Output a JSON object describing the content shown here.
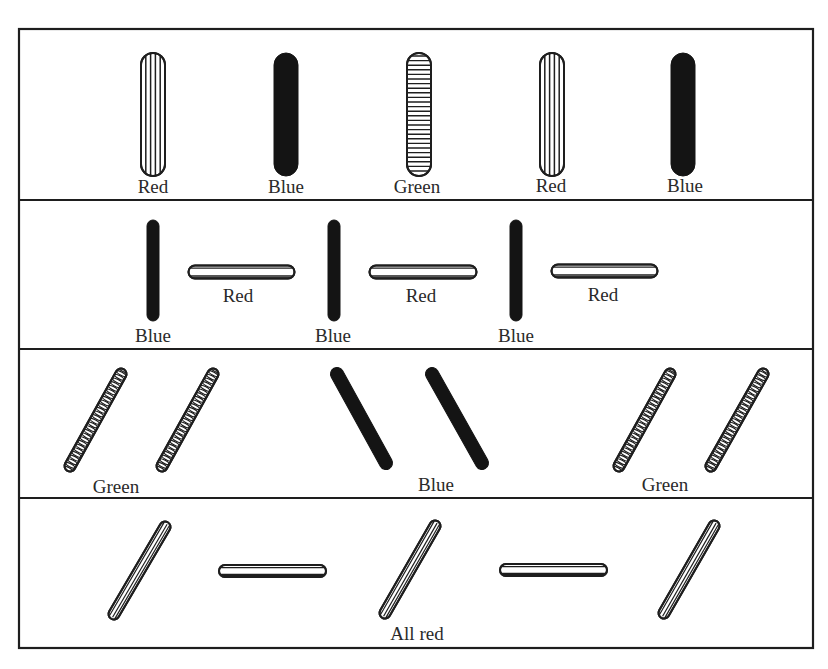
{
  "figure": {
    "frame": {
      "x": 19,
      "y": 29,
      "w": 794,
      "h": 619
    },
    "dividers_y": [
      200,
      349,
      498
    ],
    "ink": "#1e1e1e",
    "fill_light": "#ffffff",
    "fill_dark": "#141414"
  },
  "rows": [
    {
      "id": "row-1",
      "rods": [
        {
          "color": "red",
          "pattern": "vertical-lines",
          "x1": 153,
          "y1": 65,
          "x2": 153,
          "y2": 164,
          "width": 24
        },
        {
          "color": "blue",
          "pattern": "solid",
          "x1": 286,
          "y1": 65,
          "x2": 286,
          "y2": 164,
          "width": 24
        },
        {
          "color": "green",
          "pattern": "horizontal-lines",
          "x1": 419,
          "y1": 65,
          "x2": 419,
          "y2": 164,
          "width": 24
        },
        {
          "color": "red",
          "pattern": "vertical-lines",
          "x1": 552,
          "y1": 65,
          "x2": 552,
          "y2": 164,
          "width": 24
        },
        {
          "color": "blue",
          "pattern": "solid",
          "x1": 683,
          "y1": 65,
          "x2": 683,
          "y2": 164,
          "width": 24
        }
      ],
      "labels": [
        {
          "text": "Red",
          "x": 153,
          "y": 177
        },
        {
          "text": "Blue",
          "x": 286,
          "y": 177
        },
        {
          "text": "Green",
          "x": 417,
          "y": 177
        },
        {
          "text": "Red",
          "x": 551,
          "y": 176
        },
        {
          "text": "Blue",
          "x": 685,
          "y": 176
        }
      ]
    },
    {
      "id": "row-2",
      "rods": [
        {
          "color": "blue",
          "pattern": "solid",
          "x1": 153,
          "y1": 226,
          "x2": 153,
          "y2": 315,
          "width": 12
        },
        {
          "color": "red",
          "pattern": "tube-h",
          "x1": 195,
          "y1": 272,
          "x2": 288,
          "y2": 272,
          "width": 13
        },
        {
          "color": "blue",
          "pattern": "solid",
          "x1": 334,
          "y1": 226,
          "x2": 334,
          "y2": 315,
          "width": 12
        },
        {
          "color": "red",
          "pattern": "tube-h",
          "x1": 376,
          "y1": 272,
          "x2": 470,
          "y2": 272,
          "width": 13
        },
        {
          "color": "blue",
          "pattern": "solid",
          "x1": 516,
          "y1": 226,
          "x2": 516,
          "y2": 315,
          "width": 12
        },
        {
          "color": "red",
          "pattern": "tube-h",
          "x1": 558,
          "y1": 271,
          "x2": 651,
          "y2": 271,
          "width": 13
        }
      ],
      "labels": [
        {
          "text": "Red",
          "x": 238,
          "y": 286
        },
        {
          "text": "Blue",
          "x": 153,
          "y": 326
        },
        {
          "text": "Red",
          "x": 421,
          "y": 286
        },
        {
          "text": "Blue",
          "x": 333,
          "y": 326
        },
        {
          "text": "Red",
          "x": 603,
          "y": 285
        },
        {
          "text": "Blue",
          "x": 516,
          "y": 326
        }
      ]
    },
    {
      "id": "row-3",
      "rods": [
        {
          "color": "green",
          "pattern": "cross-hatch",
          "x1": 70,
          "y1": 466,
          "x2": 121,
          "y2": 374,
          "width": 11
        },
        {
          "color": "green",
          "pattern": "cross-hatch",
          "x1": 162,
          "y1": 466,
          "x2": 213,
          "y2": 374,
          "width": 11
        },
        {
          "color": "blue",
          "pattern": "solid",
          "x1": 337,
          "y1": 374,
          "x2": 386,
          "y2": 463,
          "width": 13
        },
        {
          "color": "blue",
          "pattern": "solid",
          "x1": 432,
          "y1": 374,
          "x2": 482,
          "y2": 463,
          "width": 13
        },
        {
          "color": "green",
          "pattern": "cross-hatch",
          "x1": 619,
          "y1": 466,
          "x2": 670,
          "y2": 374,
          "width": 11
        },
        {
          "color": "green",
          "pattern": "cross-hatch",
          "x1": 711,
          "y1": 466,
          "x2": 763,
          "y2": 374,
          "width": 11
        }
      ],
      "labels": [
        {
          "text": "Green",
          "x": 116,
          "y": 477
        },
        {
          "text": "Blue",
          "x": 436,
          "y": 475
        },
        {
          "text": "Green",
          "x": 665,
          "y": 475
        }
      ]
    },
    {
      "id": "row-4",
      "rods": [
        {
          "color": "red",
          "pattern": "tube-diag",
          "x1": 114,
          "y1": 614,
          "x2": 165,
          "y2": 527,
          "width": 11
        },
        {
          "color": "red",
          "pattern": "tube-h",
          "x1": 225,
          "y1": 571,
          "x2": 320,
          "y2": 571,
          "width": 12
        },
        {
          "color": "red",
          "pattern": "tube-diag",
          "x1": 385,
          "y1": 613,
          "x2": 435,
          "y2": 526,
          "width": 11
        },
        {
          "color": "red",
          "pattern": "tube-h",
          "x1": 506,
          "y1": 570,
          "x2": 601,
          "y2": 570,
          "width": 12
        },
        {
          "color": "red",
          "pattern": "tube-diag",
          "x1": 664,
          "y1": 613,
          "x2": 714,
          "y2": 526,
          "width": 11
        }
      ],
      "labels": [
        {
          "text": "All red",
          "x": 417,
          "y": 624
        }
      ]
    }
  ]
}
